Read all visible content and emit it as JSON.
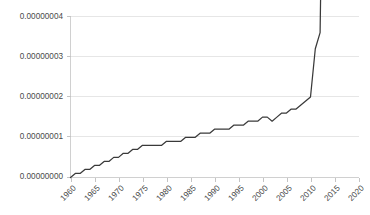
{
  "chart_data": {
    "type": "line",
    "title": "",
    "subtitle": "",
    "xlabel": "",
    "ylabel": "",
    "grid": "horizontal",
    "legend": "none",
    "xlim": [
      1960,
      2020
    ],
    "ylim": [
      0.0,
      4e-08
    ],
    "y_tick_labels": [
      "0.00000000",
      "0.00000001",
      "0.00000002",
      "0.00000003",
      "0.00000004"
    ],
    "y_tick_values": [
      0.0,
      1e-08,
      2e-08,
      3e-08,
      4e-08
    ],
    "x_tick_labels": [
      "1960",
      "1965",
      "1970",
      "1975",
      "1980",
      "1985",
      "1990",
      "1995",
      "2000",
      "2005",
      "2010",
      "2015",
      "2020"
    ],
    "x_tick_values": [
      1960,
      1965,
      1970,
      1975,
      1980,
      1985,
      1990,
      1995,
      2000,
      2005,
      2010,
      2015,
      2020
    ],
    "x_tick_rotation_deg": 45,
    "series": [
      {
        "name": "value",
        "color": "#3a3a3a",
        "x": [
          1960,
          1961,
          1962,
          1963,
          1964,
          1965,
          1966,
          1967,
          1968,
          1969,
          1970,
          1971,
          1972,
          1973,
          1974,
          1975,
          1976,
          1977,
          1978,
          1979,
          1980,
          1981,
          1982,
          1983,
          1984,
          1985,
          1986,
          1987,
          1988,
          1989,
          1990,
          1991,
          1992,
          1993,
          1994,
          1995,
          1996,
          1997,
          1998,
          1999,
          2000,
          2001,
          2002,
          2003,
          2004,
          2005,
          2006,
          2007,
          2008,
          2009,
          2010,
          2011,
          2012,
          2013,
          2014,
          2015,
          2016,
          2017,
          2018,
          2019,
          2020
        ],
        "values": [
          0.0,
          1e-09,
          1e-09,
          2e-09,
          2e-09,
          3e-09,
          3e-09,
          4e-09,
          4e-09,
          5e-09,
          5e-09,
          6e-09,
          6e-09,
          7e-09,
          7e-09,
          8e-09,
          8e-09,
          8e-09,
          8e-09,
          8e-09,
          9e-09,
          9e-09,
          9e-09,
          9e-09,
          1e-08,
          1e-08,
          1e-08,
          1.1e-08,
          1.1e-08,
          1.1e-08,
          1.2e-08,
          1.2e-08,
          1.2e-08,
          1.2e-08,
          1.3e-08,
          1.3e-08,
          1.3e-08,
          1.4e-08,
          1.4e-08,
          1.4e-08,
          1.5e-08,
          1.5e-08,
          1.4e-08,
          1.5e-08,
          1.6e-08,
          1.6e-08,
          1.7e-08,
          1.7e-08,
          1.8e-08,
          1.9e-08,
          2e-08,
          3.2e-08,
          3.6e-08,
          1.2e-07,
          7e-07,
          1.25e-06,
          1.7e-06,
          2.15e-06,
          2.6e-06,
          3e-06,
          3.45e-06
        ]
      }
    ],
    "value_min": 0.0,
    "value_max": 3.45e-08,
    "value_max_year": 2020
  }
}
